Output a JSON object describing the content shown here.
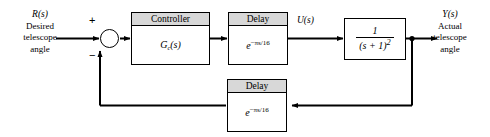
{
  "diagram": {
    "type": "control-system-block-diagram",
    "background_color": "#ffffff",
    "line_color": "#000000",
    "header_fill_color": "#d8d8d8"
  },
  "input_label": {
    "symbol": "R(s)",
    "line1": "Desired",
    "line2": "telescope",
    "line3": "angle"
  },
  "output_label": {
    "symbol": "Y(s)",
    "line1": "Actual",
    "line2": "telescope",
    "line3": "angle"
  },
  "summing_junction": {
    "name": "summing-junction",
    "plus_sign": "+",
    "minus_sign": "−"
  },
  "blocks": {
    "controller": {
      "header": "Controller",
      "expression_base": "G",
      "expression_sub": "c",
      "expression_rest": "(s)"
    },
    "forward_delay": {
      "header": "Delay",
      "expression_base": "e",
      "expression_exponent": "−πs/16"
    },
    "plant": {
      "numerator": "1",
      "denominator_base": "(s + 1)",
      "denominator_exponent": "2"
    },
    "feedback_delay": {
      "header": "Delay",
      "expression_base": "e",
      "expression_exponent": "−πs/16"
    }
  },
  "signals": {
    "control_signal": "U(s)"
  }
}
